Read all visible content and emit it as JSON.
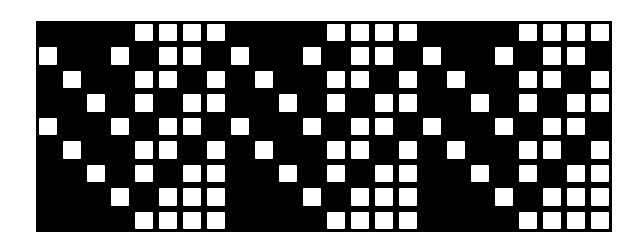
{
  "diagram": {
    "type": "weave-draft-grid",
    "columns": 24,
    "rows": 9,
    "repeat_period_columns": 8,
    "colors": {
      "filled": "#000000",
      "empty": "#ffffff"
    },
    "repeat_unit": [
      "....####",
      "#..#.##.",
      ".#..##.#",
      "..#.#.##",
      "#..#.##.",
      ".#..##.#",
      "..#.#.##",
      "...#.###",
      "....####"
    ],
    "grid": [
      "....####....####....####",
      "#..#.##.#..#.##.#..#.##.",
      ".#..##.#.#..##.#.#..##.#",
      "..#.#.##..#.#.##..#.#.##",
      "#..#.##.#..#.##.#..#.##.",
      ".#..##.#.#..##.#.#..##.#",
      "..#.#.##..#.#.##..#.#.##",
      "...#.###...#.###...#.###",
      "....####....####....####"
    ]
  }
}
